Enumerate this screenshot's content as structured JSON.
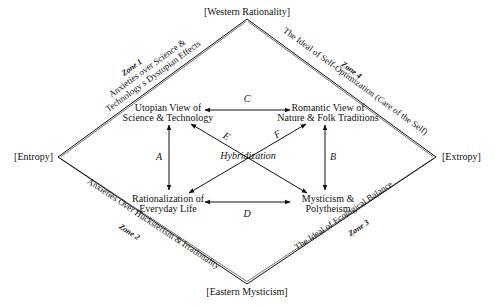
{
  "diagram": {
    "poles": {
      "top": "[Western Rationality]",
      "left": "[Entropy]",
      "right": "[Extropy]",
      "bottom": "[Eastern Mysticism]"
    },
    "zones": {
      "zone1": {
        "title": "Zone 1",
        "line1": "Anxieties over Science &",
        "line2": "Technology s Dystopian Effects"
      },
      "zone2": {
        "title": "Zone 2",
        "line1": "Anxieties Over Hucksterism & Irrationality"
      },
      "zone3": {
        "title": "Zone 3",
        "line1": "The Ideal of Ecological Balance"
      },
      "zone4": {
        "title": "Zone 4",
        "line1": "The Ideal of Self-Optimization (Care of the Self)"
      }
    },
    "nodes": {
      "utopian": {
        "line1": "Utopian View of",
        "line2": "Science & Technology"
      },
      "romantic": {
        "line1": "Romantic View of",
        "line2": "Nature & Folk Traditions"
      },
      "rationalization": {
        "line1": "Rationalization of",
        "line2": "Everyday Life"
      },
      "mysticism": {
        "line1": "Mysticism &",
        "line2": "Polytheism"
      }
    },
    "edges": {
      "A": "A",
      "B": "B",
      "C": "C",
      "D": "D",
      "E": "E",
      "F": "F",
      "center": "Hybridization"
    }
  }
}
